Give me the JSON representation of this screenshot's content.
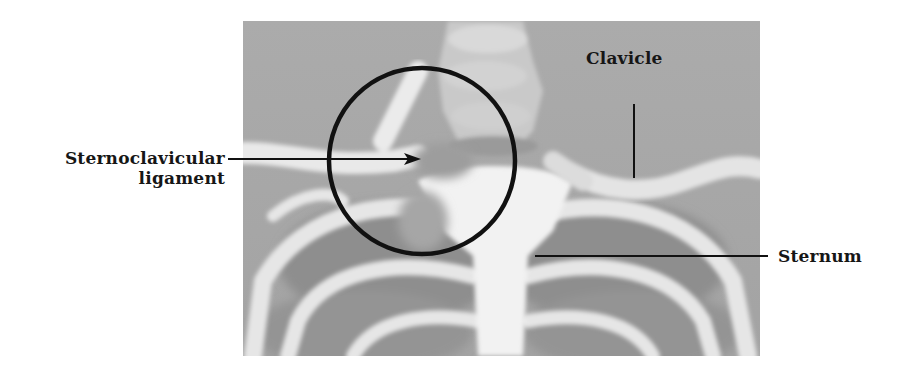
{
  "figure": {
    "photo_style": "grayscale photograph",
    "highlight": {
      "shape": "circle",
      "target": "sternoclavicular joint",
      "color": "#111111"
    },
    "labels": [
      {
        "id": "sternoclavicular-ligament",
        "lines": [
          "Sternoclavicular",
          "ligament"
        ],
        "pointer": "arrow"
      },
      {
        "id": "clavicle",
        "lines": [
          "Clavicle"
        ],
        "pointer": "line"
      },
      {
        "id": "sternum",
        "lines": [
          "Sternum"
        ],
        "pointer": "line"
      }
    ]
  },
  "colors": {
    "background": "#ffffff",
    "photo_base": "#a9a9a9",
    "bone": "#ececec",
    "shadow": "#8c8c8c",
    "ink": "#161616"
  }
}
